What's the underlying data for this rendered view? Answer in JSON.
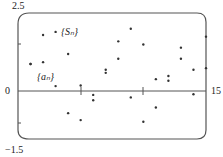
{
  "chart_data": {
    "type": "scatter",
    "title": "",
    "xlabel": "",
    "ylabel": "",
    "xlim": [
      0,
      15
    ],
    "ylim": [
      -1.5,
      2.5
    ],
    "tick_labels": {
      "y_top": "2.5",
      "y_zero": "0",
      "y_bottom": "-1.5",
      "x_right": "15"
    },
    "grid": false,
    "legend": "none",
    "annotations": [
      {
        "text": "{S_n}",
        "x": 3.4,
        "y": 1.85
      },
      {
        "text": "{a_n}",
        "x": 1.5,
        "y": 0.55
      }
    ],
    "series": [
      {
        "name": "S_n",
        "points": [
          [
            1,
            0.88
          ],
          [
            2,
            1.8
          ],
          [
            3,
            1.9
          ],
          [
            4,
            1.2
          ],
          [
            5,
            0.2
          ],
          [
            6,
            -0.1
          ],
          [
            7,
            0.7
          ],
          [
            8,
            1.6
          ],
          [
            9,
            2.0
          ],
          [
            10,
            1.5
          ],
          [
            11,
            0.4
          ],
          [
            12,
            0.5
          ],
          [
            13,
            1.4
          ],
          [
            14,
            0.7
          ],
          [
            15,
            1.75
          ]
        ]
      },
      {
        "name": "a_n",
        "points": [
          [
            1,
            0.88
          ],
          [
            2,
            0.94
          ],
          [
            3,
            0.18
          ],
          [
            4,
            -0.68
          ],
          [
            5,
            -0.9
          ],
          [
            6,
            -0.27
          ],
          [
            7,
            0.6
          ],
          [
            8,
            1.05
          ],
          [
            9,
            -0.18
          ],
          [
            10,
            -0.95
          ],
          [
            11,
            -0.5
          ],
          [
            12,
            0.35
          ],
          [
            13,
            1.05
          ],
          [
            14,
            -0.08
          ],
          [
            15,
            0.75
          ]
        ]
      }
    ]
  },
  "labels": {
    "y_top": "2.5",
    "y_zero": "0",
    "y_bottom": "−1.5",
    "x_right": "15",
    "s_label": "{Sₙ}",
    "a_label": "{aₙ}"
  }
}
